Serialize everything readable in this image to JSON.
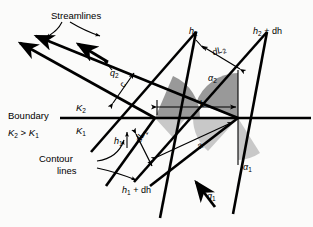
{
  "figure": {
    "background_color": "#fbfbfa",
    "line_color": "#000000",
    "shade_dark": "#999999",
    "shade_light": "#c8c8c8"
  },
  "labels": {
    "streamlines": "Streamlines",
    "contour_lines_1": "Contour",
    "contour_lines_2": "lines",
    "boundary": "Boundary",
    "k_relation_k2": "K",
    "k_relation_sub2": "2",
    "k_relation_gt": " > ",
    "k_relation_k1": "K",
    "k_relation_sub1": "1",
    "k_upper": "K",
    "k_upper_sub": "2",
    "k_lower": "K",
    "k_lower_sub": "1",
    "q2": "q",
    "q2_sub": "2",
    "q1": "q",
    "q1_sub": "1",
    "h2": "h",
    "h2_sub": "2",
    "h2_plus_dh": "h",
    "h2_plus_dh_sub": "2",
    "h2_plus_dh_rest": " + dh",
    "h1": "h",
    "h1_sub": "1",
    "h1_plus_dh": "h",
    "h1_plus_dh_sub": "1",
    "h1_plus_dh_rest": " + dh",
    "dL2": "dL",
    "dL2_sub": "2",
    "dL1": "dL",
    "dL1_sub": "1",
    "alpha2": "α",
    "alpha2_sub": "2",
    "alpha1": "α",
    "alpha1_sub": "1",
    "seg_a": "a",
    "seg_b": "b",
    "seg_c": "c"
  }
}
